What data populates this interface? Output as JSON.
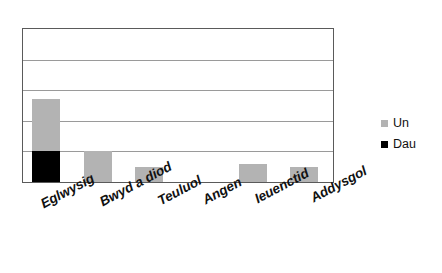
{
  "chart_data": {
    "type": "bar",
    "subtype": "stacked-vertical",
    "title": "",
    "subtitle": "",
    "xlabel": "",
    "ylabel": "",
    "grid": true,
    "ylim": [
      0,
      5
    ],
    "y_gridline_values": [
      0,
      1,
      2,
      3,
      4,
      5
    ],
    "y_tick_labels": [],
    "categories": [
      "Eglwysig",
      "Bwyd a diod",
      "Teuluol",
      "Angen",
      "Ieuenctid",
      "Addysgol"
    ],
    "series": [
      {
        "name": "Un",
        "color": "#b3b3b3",
        "values": [
          1.7,
          1.0,
          0.5,
          0.0,
          0.6,
          0.5
        ]
      },
      {
        "name": "Dau",
        "color": "#000000",
        "values": [
          1.0,
          0.0,
          0.0,
          0.0,
          0.0,
          0.0
        ]
      }
    ],
    "legend_position": "right",
    "annotations": []
  },
  "legend": {
    "entries": [
      {
        "label": "Un",
        "swatch_color": "#b3b3b3"
      },
      {
        "label": "Dau",
        "swatch_color": "#000000"
      }
    ]
  },
  "axes": {
    "x_tick_labels": [
      "Eglwysig",
      "Bwyd a diod",
      "Teuluol",
      "Angen",
      "Ieuenctid",
      "Addysgol"
    ],
    "y_tick_labels": []
  },
  "style": {
    "background": "#ffffff",
    "plot_border_color": "#5a5a5a",
    "gridline_color": "#9a9a9a",
    "text_color": "#111111"
  }
}
